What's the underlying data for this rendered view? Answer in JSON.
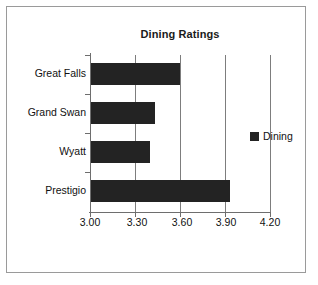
{
  "chart_data": {
    "type": "bar",
    "orientation": "horizontal",
    "title": "Dining Ratings",
    "xlabel": "",
    "ylabel": "",
    "categories": [
      "Great Falls",
      "Grand Swan",
      "Wyatt",
      "Prestigio"
    ],
    "series": [
      {
        "name": "Dining",
        "values": [
          3.6,
          3.43,
          3.4,
          3.93
        ],
        "color": "#232323"
      }
    ],
    "xlim": [
      3.0,
      4.2
    ],
    "xticks": [
      3.0,
      3.3,
      3.6,
      3.9,
      4.2
    ],
    "xtick_labels": [
      "3.00",
      "3.30",
      "3.60",
      "3.90",
      "4.20"
    ],
    "grid": "vertical",
    "legend": {
      "position": "right",
      "entries": [
        {
          "label": "Dining",
          "color": "#232323",
          "marker": "square"
        }
      ]
    }
  },
  "legend_entry_label": "Dining"
}
